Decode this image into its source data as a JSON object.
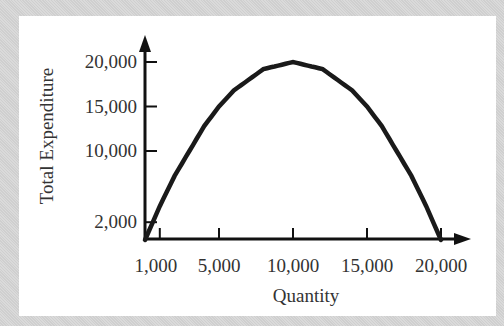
{
  "chart_data": {
    "type": "line",
    "title": "",
    "xlabel": "Quantity",
    "ylabel": "Total Expenditure",
    "x_ticks": [
      "1,000",
      "5,000",
      "10,000",
      "15,000",
      "20,000"
    ],
    "y_ticks": [
      "2,000",
      "10,000",
      "15,000",
      "20,000"
    ],
    "xlim": [
      0,
      20000
    ],
    "ylim": [
      0,
      20000
    ],
    "grid": false,
    "legend": null,
    "series": [
      {
        "name": "Total Expenditure",
        "x": [
          0,
          1000,
          2000,
          4000,
          5000,
          6000,
          8000,
          10000,
          12000,
          14000,
          15000,
          16000,
          18000,
          19000,
          20000
        ],
        "y": [
          0,
          3800,
          7200,
          12800,
          15000,
          16800,
          19200,
          20000,
          19200,
          16800,
          15000,
          12800,
          7200,
          3800,
          0
        ]
      }
    ],
    "color": "#1a1a1a"
  }
}
